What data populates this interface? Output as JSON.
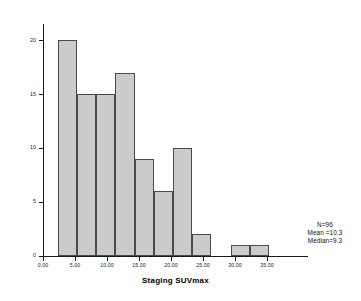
{
  "chart_data": {
    "type": "bar",
    "chart_style": "histogram",
    "title": "",
    "xlabel": "Staging SUVmax",
    "ylabel": "",
    "xlim": [
      -1.5,
      37.0
    ],
    "ylim": [
      0,
      21.5
    ],
    "grid": false,
    "legend": null,
    "bin_width": 3.0,
    "x_tick_labels": [
      "0.00",
      "5.00",
      "10.00",
      "15.00",
      "20.00",
      "25.00",
      "30.00",
      "35.00"
    ],
    "x_tick_values": [
      0,
      5,
      10,
      15,
      20,
      25,
      30,
      35
    ],
    "y_tick_labels": [
      "0",
      "5",
      "10",
      "15",
      "20"
    ],
    "y_tick_values": [
      0,
      5,
      10,
      15,
      20
    ],
    "bars": [
      {
        "bin_start": 2.3,
        "bin_end": 5.3,
        "value": 20
      },
      {
        "bin_start": 5.3,
        "bin_end": 8.3,
        "value": 15
      },
      {
        "bin_start": 8.3,
        "bin_end": 11.3,
        "value": 15
      },
      {
        "bin_start": 11.3,
        "bin_end": 14.3,
        "value": 17
      },
      {
        "bin_start": 14.3,
        "bin_end": 17.3,
        "value": 9
      },
      {
        "bin_start": 17.3,
        "bin_end": 20.3,
        "value": 6
      },
      {
        "bin_start": 20.3,
        "bin_end": 23.3,
        "value": 10
      },
      {
        "bin_start": 23.3,
        "bin_end": 26.3,
        "value": 2
      },
      {
        "bin_start": 29.3,
        "bin_end": 32.3,
        "value": 1
      },
      {
        "bin_start": 32.3,
        "bin_end": 35.3,
        "value": 1
      }
    ],
    "values": [
      20,
      15,
      15,
      17,
      9,
      6,
      10,
      2,
      1,
      1
    ],
    "colors": {
      "bar_fill": "#cbcbcb",
      "bar_border": "#4a4a4a",
      "axis": "#1a1a1a",
      "text": "#000000"
    }
  },
  "annotations": {
    "n_label": "N=96",
    "mean_label": "Mean =10.3",
    "median_label": "Median=9.3"
  }
}
